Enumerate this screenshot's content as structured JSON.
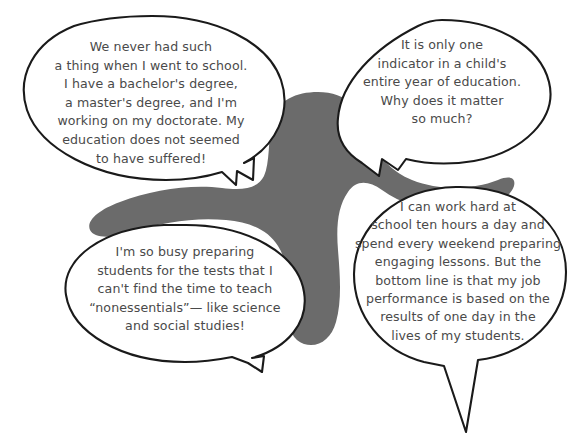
{
  "canvas": {
    "width": 586,
    "height": 443,
    "background_color": "#ffffff"
  },
  "palette": {
    "blob_fill": "#6b6b6b",
    "bubble_fill": "#ffffff",
    "outline": "#1a1a1a",
    "text_color": "#4a4a4a"
  },
  "blob": {
    "name": "gray-background-blob",
    "fill": "#6b6b6b"
  },
  "bubbles": [
    {
      "id": "bubble-top-left",
      "position": "top-left",
      "tail_direction": "down-right",
      "text": "We never had such\na thing when I went to school.\nI have a bachelor's degree,\na master's degree, and I'm\nworking on my doctorate. My\neducation does not seemed\nto have suffered!"
    },
    {
      "id": "bubble-top-right",
      "position": "top-right",
      "tail_direction": "down-left",
      "text": "It is only one\nindicator in a child's\nentire year of education.\nWhy does it matter\nso much?"
    },
    {
      "id": "bubble-bottom-left",
      "position": "bottom-left",
      "tail_direction": "down-right",
      "text": "I'm so busy preparing\nstudents for the tests that I\ncan't find the time to teach\n“nonessentials”— like science\nand social studies!"
    },
    {
      "id": "bubble-bottom-right",
      "position": "bottom-right",
      "tail_direction": "down",
      "text": "I can work hard at\nschool ten hours a day and\nspend every weekend preparing\nengaging lessons. But the\nbottom line is that my job\nperformance is based on the\nresults of one day in the\nlives of my students."
    }
  ]
}
